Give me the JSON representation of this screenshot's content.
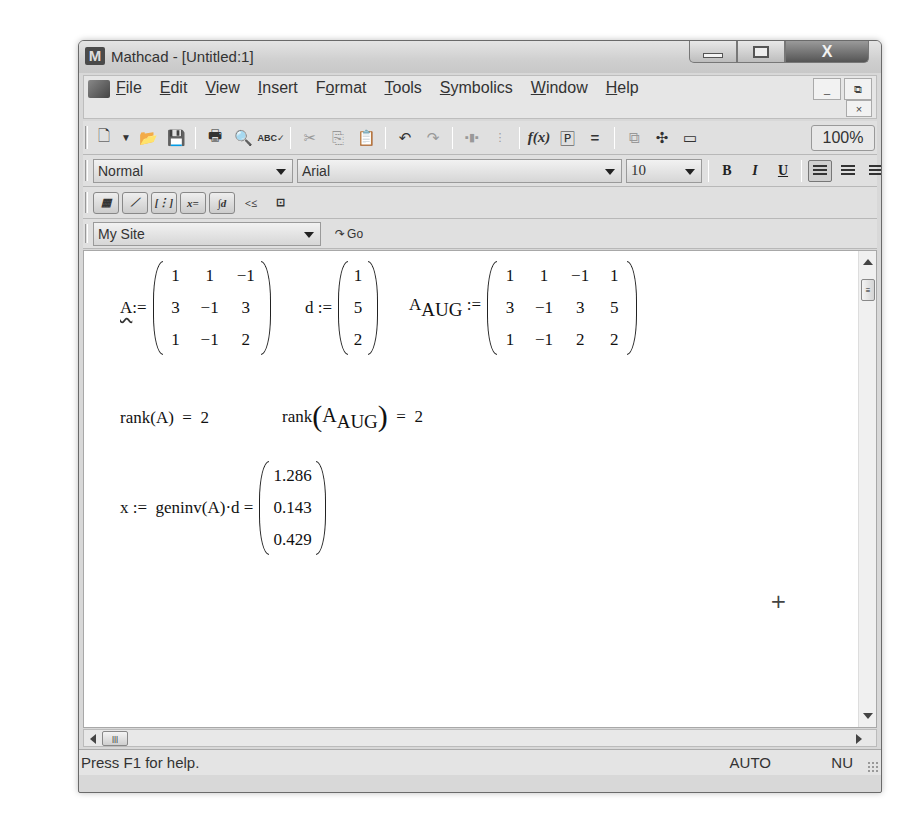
{
  "window": {
    "title": "Mathcad - [Untitled:1]",
    "app_icon_letter": "M",
    "controls": {
      "minimize": "minimize",
      "maximize": "maximize",
      "close": "X"
    }
  },
  "menubar": {
    "items": [
      {
        "label": "File",
        "accel": "F"
      },
      {
        "label": "Edit",
        "accel": "E"
      },
      {
        "label": "View",
        "accel": "V"
      },
      {
        "label": "Insert",
        "accel": "I"
      },
      {
        "label": "Format",
        "accel": "o"
      },
      {
        "label": "Tools",
        "accel": "T"
      },
      {
        "label": "Symbolics",
        "accel": "S"
      },
      {
        "label": "Window",
        "accel": "W"
      },
      {
        "label": "Help",
        "accel": "H"
      }
    ],
    "mdi": {
      "minimize": "_",
      "restore": "⧉",
      "close": "×"
    }
  },
  "standard_toolbar": {
    "icons": [
      "new-icon",
      "dropdown-icon",
      "open-icon",
      "save-icon",
      "print-icon",
      "print-preview-icon",
      "spell-check-icon",
      "cut-icon",
      "copy-icon",
      "paste-icon",
      "undo-icon",
      "redo-icon",
      "align-across-icon",
      "align-down-icon",
      "insert-function-icon",
      "insert-unit-icon",
      "calculate-icon",
      "insert-component-icon",
      "resource-icon",
      "window-icon"
    ],
    "zoom_level": "100%"
  },
  "formatting_toolbar": {
    "style": "Normal",
    "font": "Arial",
    "size": "10",
    "bold": "B",
    "italic": "I",
    "underline": "U"
  },
  "math_toolbar": {
    "buttons": [
      "calculator",
      "graph",
      "matrix",
      "evaluation",
      "calculus",
      "boolean",
      "programming",
      "greek",
      "symbolic"
    ]
  },
  "resources_toolbar": {
    "site": "My Site",
    "go_label": "Go"
  },
  "worksheet": {
    "matrix_A": {
      "name": "A",
      "operator": ":=",
      "rows": [
        [
          "1",
          "1",
          "−1"
        ],
        [
          "3",
          "−1",
          "3"
        ],
        [
          "1",
          "−1",
          "2"
        ]
      ]
    },
    "vector_d": {
      "name": "d",
      "operator": ":=",
      "rows": [
        [
          "1"
        ],
        [
          "5"
        ],
        [
          "2"
        ]
      ]
    },
    "matrix_AAUG": {
      "name": "A",
      "subscript": "AUG",
      "operator": ":=",
      "rows": [
        [
          "1",
          "1",
          "−1",
          "1"
        ],
        [
          "3",
          "−1",
          "3",
          "5"
        ],
        [
          "1",
          "−1",
          "2",
          "2"
        ]
      ]
    },
    "rank_A": {
      "func": "rank",
      "arg": "A",
      "result": "2"
    },
    "rank_AAUG": {
      "func": "rank",
      "arg": "A",
      "arg_sub": "AUG",
      "result": "2"
    },
    "solution": {
      "lhs": "x",
      "operator": ":=",
      "expr": "geninv(A)·d",
      "equals": "=",
      "rows": [
        [
          "1.286"
        ],
        [
          "0.143"
        ],
        [
          "0.429"
        ]
      ]
    }
  },
  "statusbar": {
    "help_text": "Press F1 for help.",
    "mode": "AUTO",
    "num": "NU"
  }
}
